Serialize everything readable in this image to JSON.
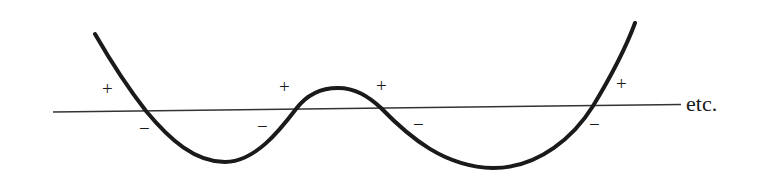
{
  "diagram": {
    "axis_label": "etc.",
    "colors": {
      "curve": "#1a1a1a",
      "axis": "#333333",
      "background": "#ffffff"
    },
    "crossings": [
      {
        "index": 1,
        "left_sign": "+",
        "right_sign": "−"
      },
      {
        "index": 2,
        "left_sign": "−",
        "right_sign": "+"
      },
      {
        "index": 3,
        "left_sign": "+",
        "right_sign": "−"
      },
      {
        "index": 4,
        "left_sign": "−",
        "right_sign": "+"
      }
    ]
  }
}
